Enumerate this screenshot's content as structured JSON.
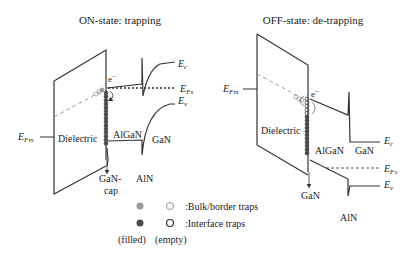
{
  "left_panel": {
    "title": "ON-state: trapping",
    "labels": {
      "efm_E": "E",
      "efm_sub": "Fm",
      "ec_E": "E",
      "ec_sub": "c",
      "efs_E": "E",
      "efs_sub": "Fs",
      "ev_E": "E",
      "ev_sub": "v",
      "electron": "e",
      "electron_sup": "−",
      "dielectric": "Dielectric",
      "algan": "AlGaN",
      "gan": "GaN",
      "gancap_1": "GaN-",
      "gancap_2": "cap",
      "aln": "AlN"
    }
  },
  "right_panel": {
    "title": "OFF-state: de-trapping",
    "labels": {
      "efm_E": "E",
      "efm_sub": "Fm",
      "ec_E": "E",
      "ec_sub": "c",
      "efs_E": "E",
      "efs_sub": "Fs",
      "ev_E": "E",
      "ev_sub": "v",
      "electron": "e",
      "electron_sup": "−",
      "dielectric": "Dielectric",
      "algan": "AlGaN",
      "gan_right": "GaN",
      "gan_bottom": "GaN",
      "aln": "AlN"
    }
  },
  "legend": {
    "bulk_label": ":Bulk/border traps",
    "interface_label": ":Interface traps",
    "filled_label": "(filled)",
    "empty_label": "(empty)"
  },
  "colors": {
    "line": "#333333",
    "bulk_filled": "#9a9a9a",
    "interface_filled": "#4a4a4a"
  }
}
